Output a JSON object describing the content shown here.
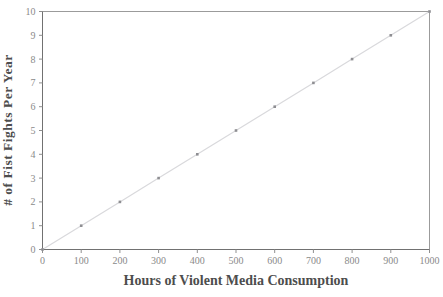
{
  "chart_data": {
    "type": "line",
    "title": "",
    "xlabel": "Hours of Violent Media Consumption",
    "ylabel": "# of Fist Fights Per Year",
    "x": [
      0,
      100,
      200,
      300,
      400,
      500,
      600,
      700,
      800,
      900,
      1000
    ],
    "y": [
      0,
      1,
      2,
      3,
      4,
      5,
      6,
      7,
      8,
      9,
      10
    ],
    "series": [
      {
        "name": "fist-fights-vs-media-hours",
        "x": [
          0,
          100,
          200,
          300,
          400,
          500,
          600,
          700,
          800,
          900,
          1000
        ],
        "values": [
          0,
          1,
          2,
          3,
          4,
          5,
          6,
          7,
          8,
          9,
          10
        ]
      }
    ],
    "xlim": [
      0,
      1000
    ],
    "ylim": [
      0,
      10
    ],
    "x_tick_step": 100,
    "y_tick_step": 1,
    "x_ticks": [
      "0",
      "100",
      "200",
      "300",
      "400",
      "500",
      "600",
      "700",
      "800",
      "900",
      "1000"
    ],
    "y_ticks": [
      "0",
      "1",
      "2",
      "3",
      "4",
      "5",
      "6",
      "7",
      "8",
      "9",
      "10"
    ],
    "grid": "off",
    "legend": "none",
    "marker": "square",
    "colors": {
      "background": "#ffffff",
      "plot_fill": "#ffffff",
      "plot_border": "#9b9b9b",
      "axis": "#717171",
      "tick": "#8f8f8f",
      "tick_label": "#8a8a8a",
      "axis_title": "#4d4d4d",
      "line": "#d9d9dc",
      "marker": "#8e8e92"
    }
  }
}
